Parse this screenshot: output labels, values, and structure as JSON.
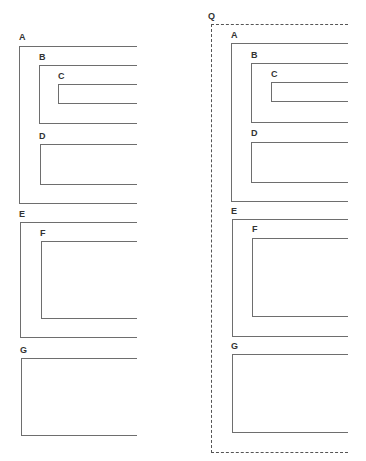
{
  "diagram": {
    "type": "nested-containment",
    "left_panel": {
      "boxes": [
        {
          "id": "A",
          "label": "A",
          "children": [
            "B",
            "D"
          ]
        },
        {
          "id": "B",
          "label": "B",
          "children": [
            "C"
          ]
        },
        {
          "id": "C",
          "label": "C",
          "children": []
        },
        {
          "id": "D",
          "label": "D",
          "children": []
        },
        {
          "id": "E",
          "label": "E",
          "children": [
            "F"
          ]
        },
        {
          "id": "F",
          "label": "F",
          "children": []
        },
        {
          "id": "G",
          "label": "G",
          "children": []
        }
      ]
    },
    "right_panel": {
      "container": {
        "id": "Q",
        "label": "Q",
        "style": "dashed",
        "children": [
          "A",
          "E",
          "G"
        ]
      },
      "boxes": [
        {
          "id": "A",
          "label": "A",
          "children": [
            "B",
            "D"
          ]
        },
        {
          "id": "B",
          "label": "B",
          "children": [
            "C"
          ]
        },
        {
          "id": "C",
          "label": "C",
          "children": []
        },
        {
          "id": "D",
          "label": "D",
          "children": []
        },
        {
          "id": "E",
          "label": "E",
          "children": [
            "F"
          ]
        },
        {
          "id": "F",
          "label": "F",
          "children": []
        },
        {
          "id": "G",
          "label": "G",
          "children": []
        }
      ]
    },
    "colors": {
      "line": "#6e6e6e",
      "dashed_line": "#555555",
      "label": "#333333",
      "background": "#ffffff"
    }
  }
}
